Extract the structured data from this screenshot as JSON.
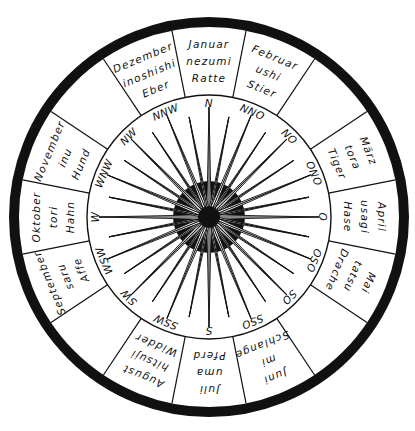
{
  "diagram": {
    "center": {
      "x": 209,
      "y": 217
    },
    "colors": {
      "ink": "#111111",
      "paper": "#ffffff"
    },
    "radii": {
      "outer_ring_outer": 200,
      "outer_ring_inner": 190,
      "compass_circle": 122,
      "ray_length": 110,
      "hub_outer": 36,
      "hub_inner": 11
    },
    "segments": [
      {
        "angle": 0,
        "lines": [
          "Januar",
          "nezumi",
          "Ratte"
        ]
      },
      {
        "angle": 22.5,
        "lines": [
          "Februar",
          "ushi",
          "Stier"
        ]
      },
      {
        "angle": 45,
        "lines": []
      },
      {
        "angle": 67.5,
        "lines": [
          "März",
          "tora",
          "Tiger"
        ]
      },
      {
        "angle": 90,
        "lines": [
          "April",
          "usagi",
          "Hase"
        ]
      },
      {
        "angle": 112.5,
        "lines": [
          "Mai",
          "tatsu",
          "Drache"
        ]
      },
      {
        "angle": 135,
        "lines": []
      },
      {
        "angle": 157.5,
        "lines": [
          "Juni",
          "mi",
          "Schlange"
        ]
      },
      {
        "angle": 180,
        "lines": [
          "Juli",
          "uma",
          "Pferd"
        ]
      },
      {
        "angle": 202.5,
        "lines": [
          "August",
          "hitsuji",
          "Widder"
        ]
      },
      {
        "angle": 225,
        "lines": []
      },
      {
        "angle": 247.5,
        "lines": [
          "September",
          "saru",
          "Affe"
        ]
      },
      {
        "angle": 270,
        "lines": [
          "Oktober",
          "tori",
          "Hahn"
        ]
      },
      {
        "angle": 292.5,
        "lines": [
          "November",
          "inu",
          "Hund"
        ]
      },
      {
        "angle": 315,
        "lines": []
      },
      {
        "angle": 337.5,
        "lines": [
          "Dezember",
          "inoshishi",
          "Eber"
        ]
      }
    ],
    "directions": [
      {
        "angle": 0,
        "label": "N"
      },
      {
        "angle": 22.5,
        "label": "NNO"
      },
      {
        "angle": 45,
        "label": "NO"
      },
      {
        "angle": 67.5,
        "label": "ONO"
      },
      {
        "angle": 90,
        "label": "O"
      },
      {
        "angle": 112.5,
        "label": "OSO"
      },
      {
        "angle": 135,
        "label": "SO"
      },
      {
        "angle": 157.5,
        "label": "SSO"
      },
      {
        "angle": 180,
        "label": "S"
      },
      {
        "angle": 202.5,
        "label": "SSW"
      },
      {
        "angle": 225,
        "label": "SW"
      },
      {
        "angle": 247.5,
        "label": "WSW"
      },
      {
        "angle": 270,
        "label": "W"
      },
      {
        "angle": 292.5,
        "label": "WNW"
      },
      {
        "angle": 315,
        "label": "NW"
      },
      {
        "angle": 337.5,
        "label": "NNW"
      }
    ],
    "ray_count": 32
  }
}
